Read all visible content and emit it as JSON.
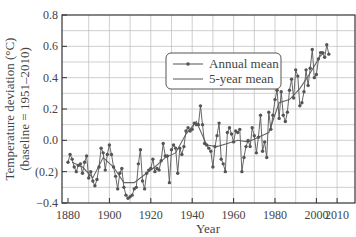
{
  "chart_data": {
    "type": "line",
    "title": "",
    "xlabel": "Year",
    "ylabel_line1": "Temperature deviation (°C)",
    "ylabel_line2": "(baseline = 1951–2010)",
    "xlim": [
      1877,
      2015
    ],
    "ylim": [
      -0.4,
      0.8
    ],
    "x_ticks": [
      1880,
      1900,
      1920,
      1940,
      1960,
      1980,
      2000,
      2010
    ],
    "x_tick_labels": [
      "1880",
      "1900",
      "1920",
      "1940",
      "1960",
      "1980",
      "2000",
      "2010"
    ],
    "x_grid_step": 10,
    "y_ticks": [
      -0.4,
      -0.2,
      0.0,
      0.2,
      0.4,
      0.6,
      0.8
    ],
    "y_tick_labels": [
      "−0.4",
      "(0.2)",
      "0.0",
      "0.2",
      "0.4",
      "0.6",
      "0.8"
    ],
    "y_grid_step": 0.1,
    "grid": true,
    "legend_position": "upper center-right",
    "series": [
      {
        "name": "Annual mean",
        "style": "line-with-markers",
        "x": [
          1880,
          1881,
          1882,
          1883,
          1884,
          1885,
          1886,
          1887,
          1888,
          1889,
          1890,
          1891,
          1892,
          1893,
          1894,
          1895,
          1896,
          1897,
          1898,
          1899,
          1900,
          1901,
          1902,
          1903,
          1904,
          1905,
          1906,
          1907,
          1908,
          1909,
          1910,
          1911,
          1912,
          1913,
          1914,
          1915,
          1916,
          1917,
          1918,
          1919,
          1920,
          1921,
          1922,
          1923,
          1924,
          1925,
          1926,
          1927,
          1928,
          1929,
          1930,
          1931,
          1932,
          1933,
          1934,
          1935,
          1936,
          1937,
          1938,
          1939,
          1940,
          1941,
          1942,
          1943,
          1944,
          1945,
          1946,
          1947,
          1948,
          1949,
          1950,
          1951,
          1952,
          1953,
          1954,
          1955,
          1956,
          1957,
          1958,
          1959,
          1960,
          1961,
          1962,
          1963,
          1964,
          1965,
          1966,
          1967,
          1968,
          1969,
          1970,
          1971,
          1972,
          1973,
          1974,
          1975,
          1976,
          1977,
          1978,
          1979,
          1980,
          1981,
          1982,
          1983,
          1984,
          1985,
          1986,
          1987,
          1988,
          1989,
          1990,
          1991,
          1992,
          1993,
          1994,
          1995,
          1996,
          1997,
          1998,
          1999,
          2000,
          2001,
          2002,
          2003,
          2004,
          2005,
          2006
        ],
        "values": [
          -0.14,
          -0.09,
          -0.12,
          -0.17,
          -0.2,
          -0.16,
          -0.15,
          -0.21,
          -0.14,
          -0.1,
          -0.24,
          -0.2,
          -0.26,
          -0.29,
          -0.25,
          -0.17,
          -0.05,
          -0.08,
          -0.19,
          -0.09,
          -0.03,
          -0.09,
          -0.17,
          -0.23,
          -0.31,
          -0.21,
          -0.18,
          -0.3,
          -0.35,
          -0.37,
          -0.36,
          -0.35,
          -0.31,
          -0.3,
          -0.15,
          -0.06,
          -0.26,
          -0.31,
          -0.21,
          -0.19,
          -0.18,
          -0.12,
          -0.2,
          -0.18,
          -0.19,
          -0.13,
          -0.02,
          -0.1,
          -0.1,
          -0.27,
          -0.06,
          -0.03,
          -0.05,
          -0.21,
          -0.05,
          -0.09,
          -0.04,
          0.06,
          0.08,
          0.06,
          0.07,
          0.11,
          0.1,
          0.1,
          0.22,
          0.1,
          -0.02,
          -0.03,
          -0.05,
          -0.07,
          -0.17,
          -0.04,
          0.03,
          0.11,
          -0.12,
          -0.15,
          -0.2,
          0.05,
          0.08,
          0.04,
          -0.01,
          0.06,
          0.05,
          0.07,
          -0.2,
          -0.11,
          -0.04,
          0.0,
          -0.04,
          0.08,
          0.03,
          -0.08,
          0.02,
          0.16,
          -0.07,
          -0.01,
          -0.11,
          0.18,
          0.07,
          0.16,
          0.26,
          0.32,
          0.14,
          0.31,
          0.16,
          0.12,
          0.18,
          0.32,
          0.39,
          0.27,
          0.45,
          0.41,
          0.22,
          0.24,
          0.31,
          0.45,
          0.35,
          0.46,
          0.58,
          0.4,
          0.42,
          0.52,
          0.56,
          0.56,
          0.53,
          0.61,
          0.55
        ]
      },
      {
        "name": "5-year mean",
        "style": "line",
        "x": [
          1882,
          1887,
          1892,
          1897,
          1902,
          1907,
          1912,
          1917,
          1922,
          1927,
          1932,
          1937,
          1942,
          1947,
          1952,
          1957,
          1962,
          1967,
          1972,
          1977,
          1982,
          1987,
          1992,
          1997,
          2002,
          2004
        ],
        "values": [
          -0.14,
          -0.17,
          -0.24,
          -0.11,
          -0.17,
          -0.27,
          -0.27,
          -0.22,
          -0.17,
          -0.11,
          -0.08,
          0.04,
          0.12,
          -0.03,
          -0.04,
          -0.02,
          0.0,
          -0.01,
          0.02,
          0.05,
          0.24,
          0.26,
          0.33,
          0.43,
          0.54,
          0.56
        ]
      }
    ]
  },
  "legend": {
    "annual_label": "Annual mean",
    "five_year_label": "5-year mean"
  },
  "axes": {
    "xlabel": "Year",
    "ylabel_line1": "Temperature deviation (°C)",
    "ylabel_line2": "(baseline = 1951–2010)"
  },
  "colors": {
    "line": "#555555",
    "marker": "#555555",
    "grid": "#bbbbbb",
    "frame": "#333333",
    "legend_border": "#555555"
  }
}
